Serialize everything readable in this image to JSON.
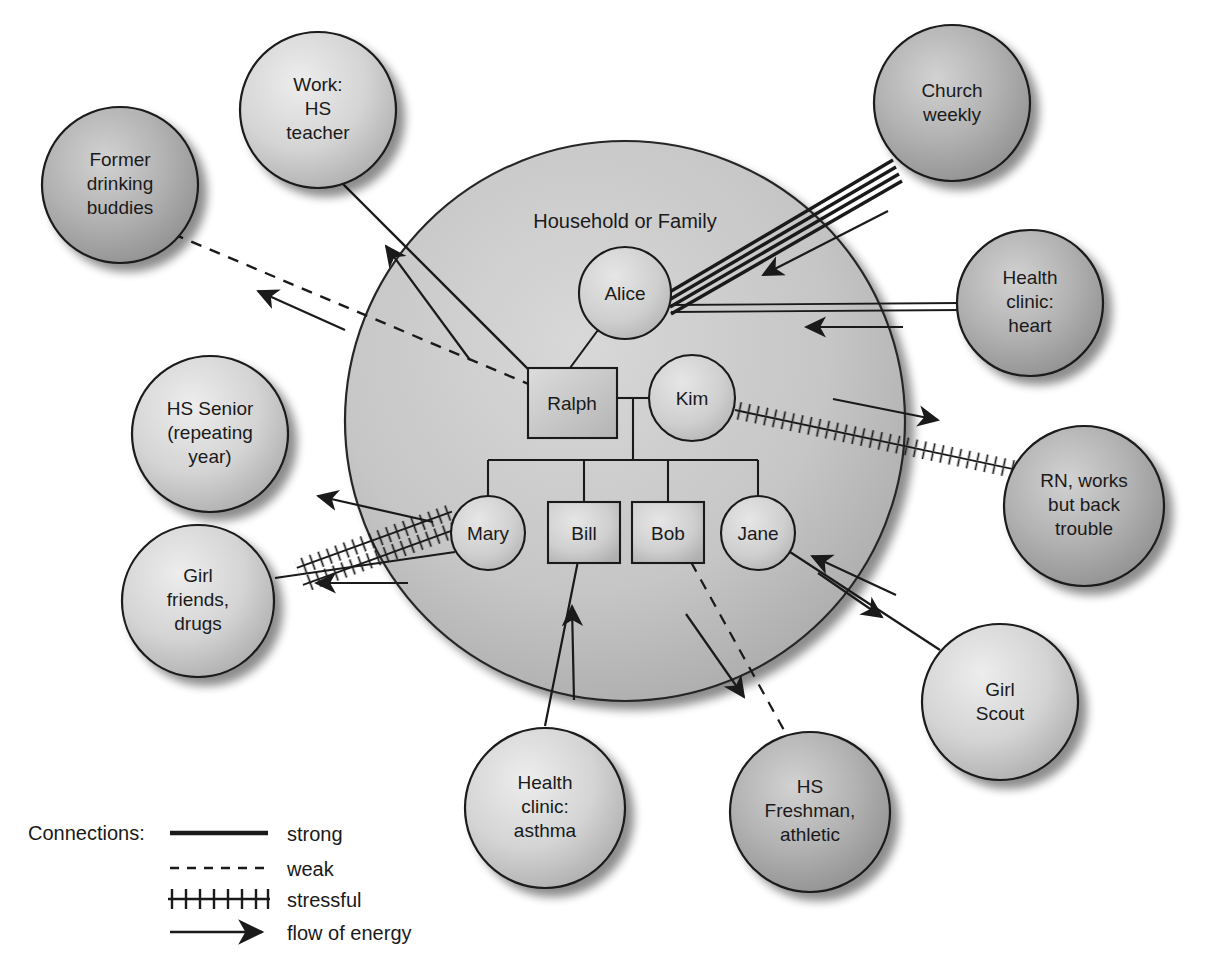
{
  "diagram": {
    "title": "Household or Family",
    "type": "ecomap"
  },
  "family": {
    "members": [
      {
        "id": "alice",
        "label": "Alice",
        "shape": "circle"
      },
      {
        "id": "ralph",
        "label": "Ralph",
        "shape": "square"
      },
      {
        "id": "kim",
        "label": "Kim",
        "shape": "circle"
      },
      {
        "id": "mary",
        "label": "Mary",
        "shape": "circle"
      },
      {
        "id": "bill",
        "label": "Bill",
        "shape": "square"
      },
      {
        "id": "bob",
        "label": "Bob",
        "shape": "square"
      },
      {
        "id": "jane",
        "label": "Jane",
        "shape": "circle"
      }
    ]
  },
  "externals": [
    {
      "id": "drinking",
      "lines": [
        "Former",
        "drinking",
        "buddies"
      ],
      "shade": "dark"
    },
    {
      "id": "work",
      "lines": [
        "Work:",
        "HS",
        "teacher"
      ],
      "shade": "light"
    },
    {
      "id": "church",
      "lines": [
        "Church",
        "weekly"
      ],
      "shade": "dark"
    },
    {
      "id": "clinic_heart",
      "lines": [
        "Health",
        "clinic:",
        "heart"
      ],
      "shade": "dark"
    },
    {
      "id": "hs_senior",
      "lines": [
        "HS Senior",
        "(repeating",
        "year)"
      ],
      "shade": "light"
    },
    {
      "id": "rn",
      "lines": [
        "RN, works",
        "but back",
        "trouble"
      ],
      "shade": "dark"
    },
    {
      "id": "girlfriends",
      "lines": [
        "Girl",
        "friends,",
        "drugs"
      ],
      "shade": "light"
    },
    {
      "id": "girlscout",
      "lines": [
        "Girl",
        "Scout"
      ],
      "shade": "light"
    },
    {
      "id": "clinic_asthma",
      "lines": [
        "Health",
        "clinic:",
        "asthma"
      ],
      "shade": "light"
    },
    {
      "id": "hs_freshman",
      "lines": [
        "HS",
        "Freshman,",
        "athletic"
      ],
      "shade": "dark"
    }
  ],
  "connections": [
    {
      "from": "ralph",
      "to": "drinking",
      "kind": "weak"
    },
    {
      "from": "ralph",
      "to": "work",
      "kind": "strong"
    },
    {
      "from": "alice",
      "to": "church",
      "kind": "strong"
    },
    {
      "from": "alice",
      "to": "clinic_heart",
      "kind": "strong"
    },
    {
      "from": "mary",
      "to": "hs_senior",
      "kind": "stressful"
    },
    {
      "from": "mary",
      "to": "girlfriends",
      "kind": "strong"
    },
    {
      "from": "kim",
      "to": "rn",
      "kind": "stressful"
    },
    {
      "from": "bill",
      "to": "clinic_asthma",
      "kind": "strong"
    },
    {
      "from": "bob",
      "to": "hs_freshman",
      "kind": "weak"
    },
    {
      "from": "jane",
      "to": "girlscout",
      "kind": "strong"
    }
  ],
  "legend": {
    "title": "Connections:",
    "items": [
      {
        "key": "strong",
        "label": "strong"
      },
      {
        "key": "weak",
        "label": "weak"
      },
      {
        "key": "stressful",
        "label": "stressful"
      },
      {
        "key": "energy",
        "label": "flow of energy"
      }
    ]
  },
  "colors": {
    "ink": "#1a1a1a",
    "household_fill": "#c8c8c8",
    "node_light": "#d6d6d6",
    "node_dark": "#a8a8a8",
    "background": "#ffffff"
  }
}
